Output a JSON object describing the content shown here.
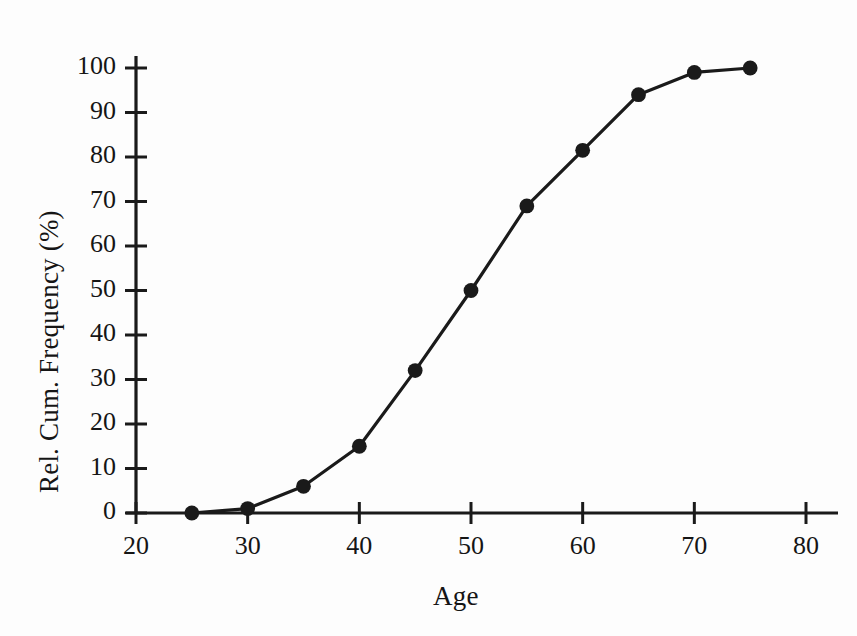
{
  "chart_data": {
    "type": "line",
    "title": "",
    "subtitle": "",
    "xlabel": "Age",
    "ylabel": "Rel. Cum. Frequency (%)",
    "xlim": [
      20,
      80
    ],
    "ylim": [
      0,
      100
    ],
    "xticks": [
      20,
      30,
      40,
      50,
      60,
      70,
      80
    ],
    "yticks": [
      0,
      10,
      20,
      30,
      40,
      50,
      60,
      70,
      80,
      90,
      100
    ],
    "grid": false,
    "legend": false,
    "legend_position": "none",
    "marker": "filled-circle",
    "line_color": "#1a1a1a",
    "marker_color": "#1a1a1a",
    "x": [
      25,
      30,
      35,
      40,
      45,
      50,
      55,
      60,
      65,
      70,
      75
    ],
    "values": [
      0,
      1,
      6,
      15,
      32,
      50,
      69,
      81.5,
      94,
      99,
      100
    ],
    "series": [
      {
        "name": "Rel. Cum. Frequency",
        "x": [
          25,
          30,
          35,
          40,
          45,
          50,
          55,
          60,
          65,
          70,
          75
        ],
        "values": [
          0,
          1,
          6,
          15,
          32,
          50,
          69,
          81.5,
          94,
          99,
          100
        ]
      }
    ],
    "annotations": []
  },
  "axes": {
    "x_title": "Age",
    "y_title": "Rel. Cum. Frequency (%)",
    "x_tick_labels": [
      "20",
      "30",
      "40",
      "50",
      "60",
      "70",
      "80"
    ],
    "y_tick_labels": [
      "0",
      "10",
      "20",
      "30",
      "40",
      "50",
      "60",
      "70",
      "80",
      "90",
      "100"
    ]
  }
}
